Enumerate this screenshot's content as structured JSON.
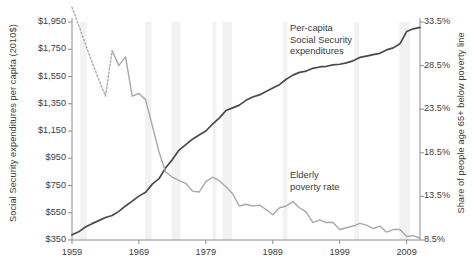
{
  "chart_data": {
    "type": "line",
    "title": "",
    "xlabel": "",
    "ylabel": "Social Security expenditures per capita (2010$)",
    "ylabel_right": "Share of people age 65+ below poverty line",
    "x_ticks": [
      "1959",
      "1969",
      "1979",
      "1989",
      "1999",
      "2009"
    ],
    "x_tick_values": [
      1959,
      1969,
      1979,
      1989,
      1999,
      2009
    ],
    "xlim": [
      1959,
      2011
    ],
    "y_ticks_left": [
      "$350",
      "$550",
      "$750",
      "$950",
      "$1,150",
      "$1,350",
      "$1,550",
      "$1,750",
      "$1,950"
    ],
    "y_tick_values_left": [
      350,
      550,
      750,
      950,
      1150,
      1350,
      1550,
      1750,
      1950
    ],
    "ylim_left": [
      350,
      1950
    ],
    "y_ticks_right": [
      "8.5%",
      "13.5%",
      "18.5%",
      "23.5%",
      "28.5%",
      "33.5%"
    ],
    "y_tick_values_right": [
      8.5,
      13.5,
      18.5,
      23.5,
      28.5,
      33.5
    ],
    "ylim_right": [
      8.5,
      33.5
    ],
    "grid": false,
    "legend": "inline-annotations",
    "annotations": [
      {
        "name": "expenditures",
        "text": "Per-capita\nSocial Security\nexpenditures"
      },
      {
        "name": "poverty",
        "text": "Elderly\npoverty rate"
      }
    ],
    "colors": {
      "expenditures_line": "#4a4a4a",
      "poverty_line": "#a8a8a8",
      "axis": "#8c8c8c",
      "recession_band": "#f2f2f2",
      "text": "#3a3a3a",
      "background": "#ffffff"
    },
    "recession_bands": [
      [
        1960.2,
        1961.2
      ],
      [
        1969.9,
        1970.9
      ],
      [
        1973.9,
        1975.2
      ],
      [
        1980.0,
        1980.6
      ],
      [
        1981.5,
        1982.9
      ],
      [
        1990.5,
        1991.2
      ],
      [
        2001.2,
        2001.9
      ],
      [
        2007.9,
        2009.5
      ]
    ],
    "series": [
      {
        "name": "Per-capita Social Security expenditures",
        "axis": "left",
        "units": "2010 dollars per capita",
        "color": "#4a4a4a",
        "style": "solid",
        "x": [
          1959,
          1960,
          1961,
          1962,
          1963,
          1964,
          1965,
          1966,
          1967,
          1968,
          1969,
          1970,
          1971,
          1972,
          1973,
          1974,
          1975,
          1976,
          1977,
          1978,
          1979,
          1980,
          1981,
          1982,
          1983,
          1984,
          1985,
          1986,
          1987,
          1988,
          1989,
          1990,
          1991,
          1992,
          1993,
          1994,
          1995,
          1996,
          1997,
          1998,
          1999,
          2000,
          2001,
          2002,
          2003,
          2004,
          2005,
          2006,
          2007,
          2008,
          2009,
          2010,
          2011
        ],
        "values": [
          388,
          410,
          445,
          470,
          492,
          515,
          530,
          560,
          600,
          635,
          672,
          700,
          760,
          800,
          880,
          940,
          1010,
          1050,
          1090,
          1120,
          1150,
          1200,
          1245,
          1300,
          1320,
          1340,
          1375,
          1400,
          1415,
          1440,
          1465,
          1490,
          1530,
          1560,
          1580,
          1590,
          1610,
          1620,
          1625,
          1635,
          1640,
          1650,
          1665,
          1690,
          1700,
          1710,
          1720,
          1745,
          1760,
          1790,
          1880,
          1900,
          1910
        ]
      },
      {
        "name": "Elderly poverty rate",
        "axis": "right",
        "units": "percent",
        "color": "#a8a8a8",
        "style": "solid-with-dotted-start",
        "dotted_range": [
          1959,
          1965
        ],
        "x": [
          1959,
          1960,
          1961,
          1962,
          1963,
          1964,
          1965,
          1966,
          1967,
          1968,
          1969,
          1970,
          1971,
          1972,
          1973,
          1974,
          1975,
          1976,
          1977,
          1978,
          1979,
          1980,
          1981,
          1982,
          1983,
          1984,
          1985,
          1986,
          1987,
          1988,
          1989,
          1990,
          1991,
          1992,
          1993,
          1994,
          1995,
          1996,
          1997,
          1998,
          1999,
          2000,
          2001,
          2002,
          2003,
          2004,
          2005,
          2006,
          2007,
          2008,
          2009,
          2010,
          2011
        ],
        "values": [
          35.2,
          33.1,
          31.0,
          28.9,
          26.9,
          25.0,
          30.2,
          28.5,
          29.5,
          25.0,
          25.3,
          24.6,
          21.6,
          18.6,
          16.3,
          15.7,
          15.3,
          15.0,
          14.1,
          14.0,
          15.2,
          15.7,
          15.3,
          14.6,
          13.8,
          12.4,
          12.6,
          12.4,
          12.5,
          12.0,
          11.4,
          12.2,
          12.4,
          12.9,
          12.2,
          11.7,
          10.5,
          10.8,
          10.5,
          10.5,
          9.7,
          9.9,
          10.1,
          10.4,
          10.2,
          9.8,
          10.1,
          9.4,
          9.7,
          9.7,
          8.9,
          9.0,
          8.7
        ]
      }
    ]
  }
}
